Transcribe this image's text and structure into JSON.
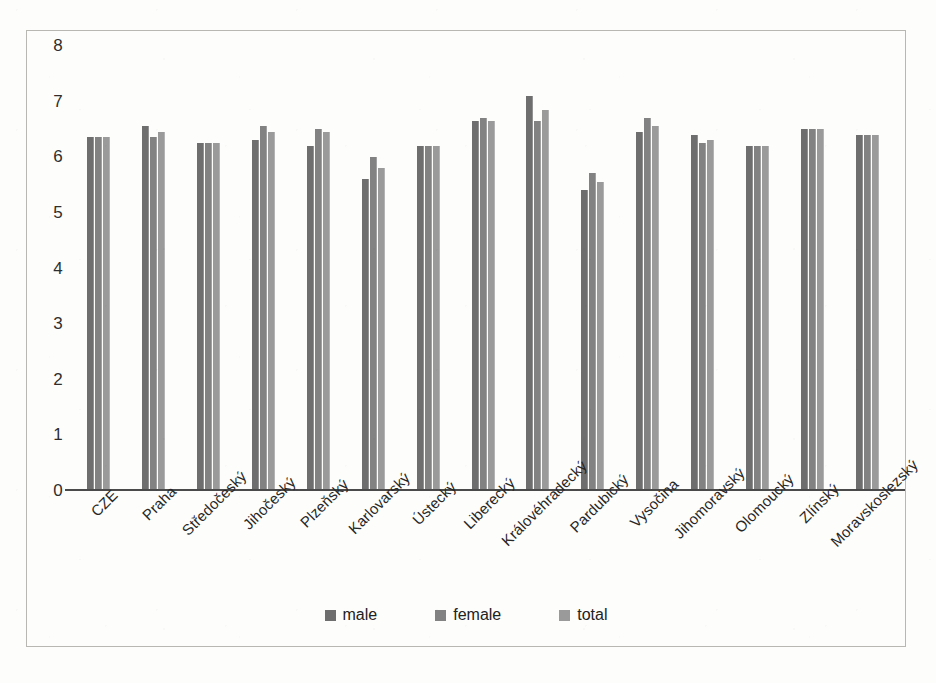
{
  "chart_data": {
    "type": "bar",
    "title": "",
    "subtitle": "",
    "xlabel": "",
    "ylabel": "",
    "ylim": [
      0,
      8
    ],
    "ytick_labels": [
      "8",
      "7",
      "6",
      "5",
      "4",
      "3",
      "2",
      "1",
      "0"
    ],
    "ytick_values": [
      8,
      7,
      6,
      5,
      4,
      3,
      2,
      1,
      0
    ],
    "grid": false,
    "legend_position": "bottom",
    "categories": [
      "CZE",
      "Praha",
      "Středočeský",
      "Jihočeský",
      "Plzeňský",
      "Karlovarský",
      "Ústecký",
      "Liberecký",
      "Královéhradecký",
      "Pardubický",
      "Vysočina",
      "Jihomoravský",
      "Olomoucký",
      "Zlínský",
      "Moravskoslezský"
    ],
    "series": [
      {
        "name": "male",
        "color": "#6e6e6e",
        "values": [
          6.35,
          6.55,
          6.25,
          6.3,
          6.2,
          5.6,
          6.2,
          6.65,
          7.1,
          5.4,
          6.45,
          6.4,
          6.2,
          6.5,
          6.4
        ]
      },
      {
        "name": "female",
        "color": "#828282",
        "values": [
          6.35,
          6.35,
          6.25,
          6.55,
          6.5,
          6.0,
          6.2,
          6.7,
          6.65,
          5.7,
          6.7,
          6.25,
          6.2,
          6.5,
          6.4
        ]
      },
      {
        "name": "total",
        "color": "#9a9a9a",
        "values": [
          6.35,
          6.45,
          6.25,
          6.45,
          6.45,
          5.8,
          6.2,
          6.65,
          6.85,
          5.55,
          6.55,
          6.3,
          6.2,
          6.5,
          6.4
        ]
      }
    ]
  },
  "legend": {
    "items": [
      {
        "label": "male",
        "color": "#6e6e6e"
      },
      {
        "label": "female",
        "color": "#828282"
      },
      {
        "label": "total",
        "color": "#9a9a9a"
      }
    ]
  }
}
